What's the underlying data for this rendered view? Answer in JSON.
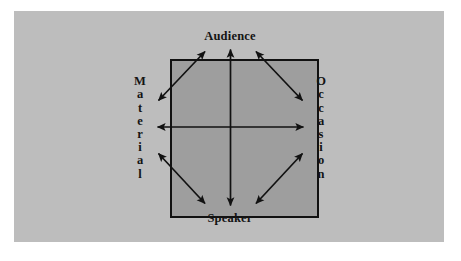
{
  "figure": {
    "plate_color": "#bdbdbd",
    "square_fill": "#9e9e9e",
    "stroke_color": "#111111",
    "text_color": "#141414"
  },
  "labels": {
    "top": "Audience",
    "bottom": "Speaker",
    "left": "Material",
    "right": "Occasion",
    "left_letters": [
      "M",
      "a",
      "t",
      "e",
      "r",
      "i",
      "a",
      "l"
    ],
    "right_letters": [
      "O",
      "c",
      "c",
      "a",
      "s",
      "i",
      "o",
      "n"
    ]
  },
  "geometry": {
    "square_left": 156,
    "square_top": 48,
    "square_right": 305,
    "square_bottom": 207,
    "center_x": 230,
    "center_y": 127
  },
  "arrows": [
    {
      "name": "vertical-axis",
      "from": "Speaker",
      "to": "Audience",
      "style": "double-headed"
    },
    {
      "name": "horizontal-axis",
      "from": "Material",
      "to": "Occasion",
      "style": "double-headed"
    },
    {
      "name": "diagonal-top-left",
      "from": "Material",
      "to": "Audience",
      "style": "double-headed"
    },
    {
      "name": "diagonal-top-right",
      "from": "Audience",
      "to": "Occasion",
      "style": "double-headed"
    },
    {
      "name": "diagonal-bottom-left",
      "from": "Material",
      "to": "Speaker",
      "style": "double-headed"
    },
    {
      "name": "diagonal-bottom-right",
      "from": "Speaker",
      "to": "Occasion",
      "style": "double-headed"
    }
  ]
}
